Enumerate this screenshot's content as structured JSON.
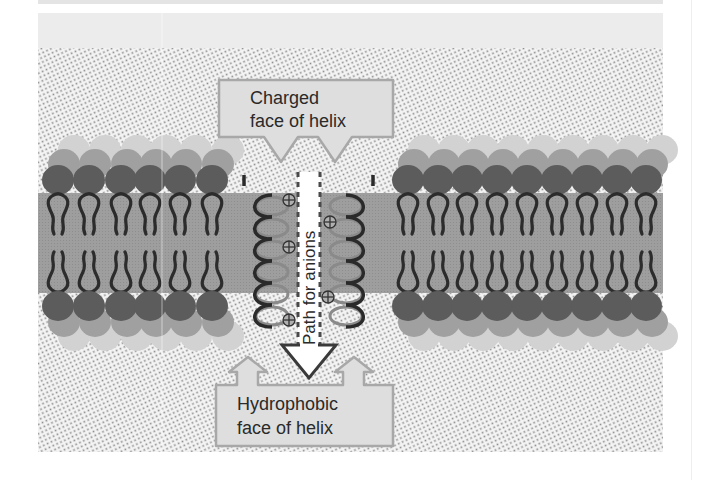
{
  "figure": {
    "labels": {
      "charged_line1": "Charged",
      "charged_line2": "face of helix",
      "hydrophobic_line1": "Hydrophobic",
      "hydrophobic_line2": "face of helix",
      "path": "Path for anions"
    },
    "symbols": {
      "positive_charge": "⊕"
    },
    "colors": {
      "background_dots": "#9a9a9a",
      "membrane_core": "#9c9c9c",
      "head_dark": "#5e5e5e",
      "head_mid": "#9a9a9a",
      "head_light": "#cfcfcf",
      "tails": "#2e2e2e",
      "callout_fill": "#dedede",
      "callout_stroke": "#a8a8a8",
      "channel": "#ffffff"
    }
  }
}
